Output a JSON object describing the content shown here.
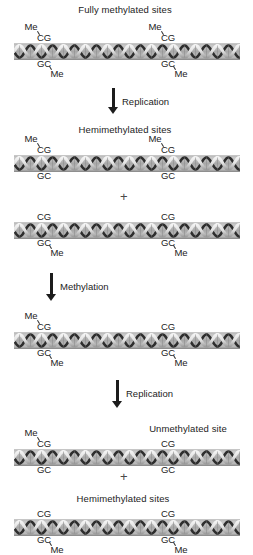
{
  "figure": {
    "title_top": "Fully methylated sites",
    "labels": {
      "me": "Me",
      "cg": "CG",
      "gc": "GC",
      "plus": "+"
    },
    "captions": [
      {
        "id": "caption-fully-methylated",
        "text": "Fully methylated sites",
        "x": 125,
        "y": 4
      },
      {
        "id": "caption-hemimethylated-1",
        "text": "Hemimethylated sites",
        "x": 125,
        "y": 124
      },
      {
        "id": "caption-unmethylated",
        "text": "Unmethylated site",
        "x": 188,
        "y": 423
      },
      {
        "id": "caption-hemimethylated-2",
        "text": "Hemimethylated sites",
        "x": 123,
        "y": 493
      }
    ],
    "arrows": [
      {
        "id": "arrow-replication-1",
        "label": "Replication",
        "x": 108,
        "y": 88,
        "length": 26,
        "label_x": 122,
        "label_y": 96
      },
      {
        "id": "arrow-methylation",
        "label": "Methylation",
        "x": 46,
        "y": 273,
        "length": 28,
        "label_x": 60,
        "label_y": 281
      },
      {
        "id": "arrow-replication-2",
        "label": "Replication",
        "x": 112,
        "y": 380,
        "length": 28,
        "label_x": 126,
        "label_y": 388
      }
    ],
    "plus_signs": [
      {
        "id": "plus-sign-1",
        "x": 120,
        "y": 190
      },
      {
        "id": "plus-sign-2",
        "x": 120,
        "y": 470
      }
    ],
    "strands": [
      {
        "id": "strand-fully-methylated",
        "y": 43,
        "x": 14,
        "width": 226,
        "sites": [
          {
            "x": 44,
            "top_me": true,
            "bottom_me": true
          },
          {
            "x": 168,
            "top_me": true,
            "bottom_me": true
          }
        ]
      },
      {
        "id": "strand-hemimethylated-top-1",
        "y": 155,
        "x": 14,
        "width": 226,
        "sites": [
          {
            "x": 44,
            "top_me": true,
            "bottom_me": false
          },
          {
            "x": 168,
            "top_me": true,
            "bottom_me": false
          }
        ]
      },
      {
        "id": "strand-hemimethylated-bottom-1",
        "y": 222,
        "x": 14,
        "width": 226,
        "sites": [
          {
            "x": 44,
            "top_me": false,
            "bottom_me": true
          },
          {
            "x": 168,
            "top_me": false,
            "bottom_me": true
          }
        ]
      },
      {
        "id": "strand-remethylated",
        "y": 332,
        "x": 14,
        "width": 226,
        "sites": [
          {
            "x": 44,
            "top_me": true,
            "bottom_me": true
          },
          {
            "x": 168,
            "top_me": false,
            "bottom_me": true
          }
        ]
      },
      {
        "id": "strand-unmethylated",
        "y": 449,
        "x": 14,
        "width": 226,
        "sites": [
          {
            "x": 44,
            "top_me": true,
            "bottom_me": false
          },
          {
            "x": 168,
            "top_me": false,
            "bottom_me": false
          }
        ]
      },
      {
        "id": "strand-hemimethylated-2",
        "y": 519,
        "x": 14,
        "width": 226,
        "sites": [
          {
            "x": 44,
            "top_me": false,
            "bottom_me": true
          },
          {
            "x": 168,
            "top_me": false,
            "bottom_me": true
          }
        ]
      }
    ]
  }
}
